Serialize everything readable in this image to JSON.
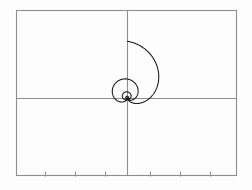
{
  "figure": {
    "name": "polar-curve-plot",
    "background_color": "#fdfdfd",
    "frame_color": "#8e8e8e",
    "curve_color": "#161616",
    "width": 252,
    "height": 190
  },
  "chart_data": {
    "type": "line",
    "title": "",
    "subtitle": "",
    "xlabel": "",
    "ylabel": "",
    "grid": false,
    "legend": null,
    "legend_position": "none",
    "coordinate_system": "polar",
    "polar_equation": "r = a * (1 + cos(theta)) * k^(theta/(2*pi))",
    "parameters": {
      "a": 1.0,
      "k": 0.34,
      "theta_min": 0,
      "theta_max": 25.13,
      "theta_units": "radians",
      "turns": 4,
      "samples": 3000
    },
    "axes": {
      "x_axis_pixel": 98,
      "y_axis_pixel": 127,
      "frame_left": 16,
      "frame_right": 237,
      "frame_top": 10,
      "frame_bottom": 176,
      "xlim": [
        -1.85,
        1.85
      ],
      "ylim": [
        -1.1,
        1.3
      ],
      "x_ticks_visible": true,
      "y_ticks_visible": false,
      "tick_labels": [],
      "x_tick_pixels": [
        45,
        75,
        105,
        150,
        180,
        210
      ],
      "x_tick_length": 5,
      "x_tick_side": "bottom"
    },
    "curve_extents": {
      "apex_top_pixel_y": 20,
      "left_pixel_x": 74,
      "right_pixel_x": 184,
      "origin_pixel": [
        127,
        98
      ]
    },
    "series": [
      {
        "name": "nested-loop-polar-curve",
        "color": "#161616",
        "linewidth": 1.05,
        "loops": [
          {
            "index": 1,
            "scale": 1.0,
            "max_radius_px": 57
          },
          {
            "index": 2,
            "scale": 0.34,
            "max_radius_px": 19
          },
          {
            "index": 3,
            "scale": 0.1156,
            "max_radius_px": 6.6
          },
          {
            "index": 4,
            "scale": 0.0393,
            "max_radius_px": 2.2
          }
        ]
      }
    ]
  }
}
